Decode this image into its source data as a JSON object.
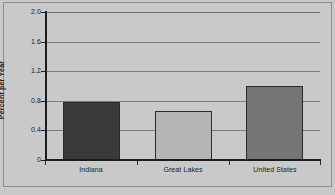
{
  "chart_data": {
    "type": "bar",
    "title": "",
    "subtitle": "",
    "xlabel": "",
    "ylabel": "Percent per Year",
    "categories": [
      "Indiana",
      "Great Lakes",
      "United States"
    ],
    "values": [
      0.78,
      0.66,
      1.0
    ],
    "series": [
      {
        "name": "Percent per Year",
        "values": [
          0.78,
          0.66,
          1.0
        ]
      }
    ],
    "ylim": [
      0,
      2.0
    ],
    "ytick_labels": [
      "0",
      "0.4",
      "0.8",
      "1.2",
      "1.6",
      "2.0"
    ],
    "ytick_values": [
      0,
      0.4,
      0.8,
      1.2,
      1.6,
      2.0
    ],
    "grid": true,
    "legend": false,
    "legend_position": "none",
    "bar_colors": [
      "#3a3a3a",
      "#b5b5b5",
      "#757575"
    ],
    "plot_background": "#c9c9c9",
    "gridline_color": "#7d7d7d",
    "axis_color": "#1c1c1c",
    "annotations": []
  }
}
